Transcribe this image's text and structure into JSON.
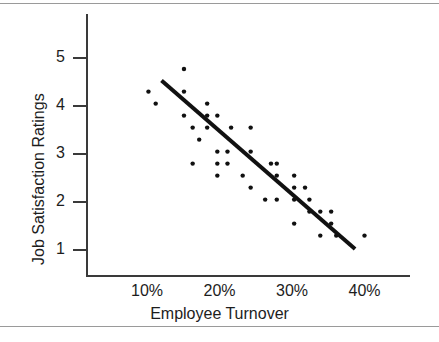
{
  "chart_data": {
    "type": "scatter",
    "title": "",
    "xlabel": "Employee Turnover",
    "ylabel": "Job Satisfaction Ratings",
    "xlim": [
      5,
      43
    ],
    "ylim": [
      0.45,
      5.6
    ],
    "grid": false,
    "legend": null,
    "xticks": [
      10,
      20,
      30,
      40
    ],
    "xtick_labels": [
      "10%",
      "20%",
      "30%",
      "40%"
    ],
    "yticks": [
      1,
      2,
      3,
      4,
      5
    ],
    "ytick_labels": [
      "1",
      "2",
      "3",
      "4",
      "5"
    ],
    "marker_color": "#111111",
    "line_color": "#111111",
    "points": [
      {
        "x": 10.2,
        "y": 4.3
      },
      {
        "x": 11.2,
        "y": 4.05
      },
      {
        "x": 15.1,
        "y": 4.77
      },
      {
        "x": 15.1,
        "y": 4.3
      },
      {
        "x": 15.1,
        "y": 3.8
      },
      {
        "x": 16.3,
        "y": 3.55
      },
      {
        "x": 16.3,
        "y": 2.8
      },
      {
        "x": 17.2,
        "y": 3.3
      },
      {
        "x": 18.3,
        "y": 4.05
      },
      {
        "x": 18.3,
        "y": 3.8
      },
      {
        "x": 18.3,
        "y": 3.55
      },
      {
        "x": 19.7,
        "y": 3.8
      },
      {
        "x": 19.7,
        "y": 3.05
      },
      {
        "x": 19.7,
        "y": 2.8
      },
      {
        "x": 19.7,
        "y": 2.55
      },
      {
        "x": 21.1,
        "y": 3.05
      },
      {
        "x": 21.1,
        "y": 2.8
      },
      {
        "x": 21.6,
        "y": 3.55
      },
      {
        "x": 23.2,
        "y": 2.55
      },
      {
        "x": 24.3,
        "y": 3.55
      },
      {
        "x": 24.3,
        "y": 3.05
      },
      {
        "x": 24.3,
        "y": 2.3
      },
      {
        "x": 26.3,
        "y": 2.05
      },
      {
        "x": 27.1,
        "y": 2.8
      },
      {
        "x": 27.9,
        "y": 2.8
      },
      {
        "x": 27.9,
        "y": 2.55
      },
      {
        "x": 27.9,
        "y": 2.05
      },
      {
        "x": 30.3,
        "y": 2.55
      },
      {
        "x": 30.3,
        "y": 2.3
      },
      {
        "x": 30.3,
        "y": 2.05
      },
      {
        "x": 30.3,
        "y": 1.55
      },
      {
        "x": 31.8,
        "y": 2.3
      },
      {
        "x": 32.4,
        "y": 2.05
      },
      {
        "x": 32.4,
        "y": 1.8
      },
      {
        "x": 33.9,
        "y": 1.8
      },
      {
        "x": 33.9,
        "y": 1.3
      },
      {
        "x": 35.4,
        "y": 1.8
      },
      {
        "x": 35.4,
        "y": 1.55
      },
      {
        "x": 36.1,
        "y": 1.3
      },
      {
        "x": 40.0,
        "y": 1.3
      }
    ],
    "trend_line": {
      "x_start": 12.0,
      "y_start": 4.53,
      "x_end": 38.7,
      "y_end": 1.02
    }
  }
}
